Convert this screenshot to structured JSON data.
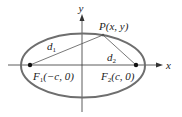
{
  "diagram": {
    "type": "ellipse-with-foci",
    "axes": {
      "x_label": "x",
      "y_label": "y"
    },
    "point": {
      "label": "P(x, y)"
    },
    "distances": {
      "d1_main": "d",
      "d1_sub": "1",
      "d2_main": "d",
      "d2_sub": "2"
    },
    "foci": {
      "f1_main": "F",
      "f1_sub": "1",
      "f1_coords": "(−c, 0)",
      "f2_main": "F",
      "f2_sub": "2",
      "f2_coords": "(c, 0)"
    },
    "colors": {
      "ellipse": "#6e6e6e",
      "axes": "#333333",
      "lines": "#555555",
      "points": "#111111"
    }
  }
}
